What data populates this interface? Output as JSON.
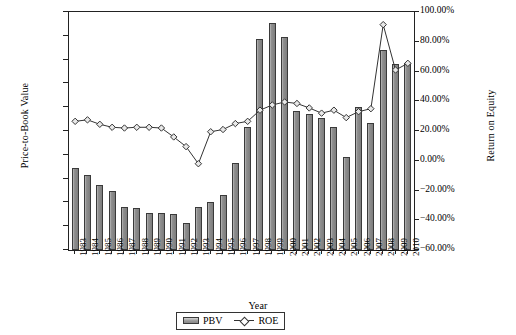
{
  "chart_data": {
    "type": "bar",
    "title": "",
    "xlabel": "Year",
    "ylabel": "Price-to-Book Value",
    "ylabel_secondary": "Return on Equity",
    "grid": false,
    "legend_position": "bottom-center",
    "ylim": [
      0,
      10
    ],
    "ylim_secondary": [
      -0.6,
      1.0
    ],
    "ytick_labels": [
      "10.00",
      "9.00",
      "8.00",
      "7.00",
      "6.00",
      "5.00",
      "4.00",
      "3.00",
      "2.00",
      "1.00",
      "0.00"
    ],
    "ytick_values": [
      10,
      9,
      8,
      7,
      6,
      5,
      4,
      3,
      2,
      1,
      0
    ],
    "ytick_labels_secondary": [
      "100.00%",
      "80.00%",
      "60.00%",
      "40.00%",
      "20.00%",
      "0.00%",
      "-20.00%",
      "-40.00%",
      "-60.00%"
    ],
    "ytick_values_secondary": [
      1.0,
      0.8,
      0.6,
      0.4,
      0.2,
      0.0,
      -0.2,
      -0.4,
      -0.6
    ],
    "categories": [
      "1983",
      "1984",
      "1985",
      "1986",
      "1987",
      "1988",
      "1989",
      "1990",
      "1991",
      "1992",
      "1993",
      "1994",
      "1995",
      "1996",
      "1997",
      "1998",
      "1999",
      "2000",
      "2001",
      "2002",
      "2003",
      "2004",
      "2005",
      "2006",
      "2007",
      "2008",
      "2009",
      "2010"
    ],
    "series": [
      {
        "name": "PBV",
        "axis": "left",
        "type": "bar",
        "values": [
          3.45,
          3.15,
          2.75,
          2.5,
          1.8,
          1.75,
          1.55,
          1.55,
          1.5,
          1.15,
          1.8,
          2.0,
          2.3,
          3.65,
          5.15,
          8.85,
          9.55,
          8.95,
          5.85,
          5.7,
          5.55,
          5.15,
          3.9,
          6.0,
          5.35,
          8.4,
          7.8,
          7.85
        ]
      },
      {
        "name": "ROE",
        "axis": "right",
        "type": "line",
        "marker": "diamond",
        "values": [
          0.265,
          0.275,
          0.245,
          0.225,
          0.22,
          0.225,
          0.225,
          0.22,
          0.16,
          0.095,
          -0.02,
          0.195,
          0.21,
          0.25,
          0.265,
          0.34,
          0.375,
          0.395,
          0.385,
          0.355,
          0.32,
          0.34,
          0.29,
          0.33,
          0.35,
          0.915,
          0.61,
          0.655
        ]
      }
    ]
  },
  "legend": {
    "items": [
      {
        "label": "PBV",
        "marker": "bar-swatch"
      },
      {
        "label": "ROE",
        "marker": "diamond-line"
      }
    ]
  }
}
